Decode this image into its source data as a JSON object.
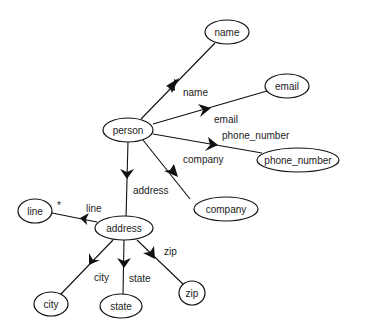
{
  "diagram": {
    "nodes": {
      "name": "name",
      "email": "email",
      "person": "person",
      "phone_number": "phone_number",
      "company": "company",
      "line": "line",
      "address": "address",
      "city": "city",
      "state": "state",
      "zip": "zip"
    },
    "edges": {
      "person_name": "name",
      "person_email": "email",
      "person_phone_number": "phone_number",
      "person_company": "company",
      "person_address": "address",
      "address_line": "line",
      "address_line_multiplicity": "*",
      "address_city": "city",
      "address_state": "state",
      "address_zip": "zip"
    }
  }
}
